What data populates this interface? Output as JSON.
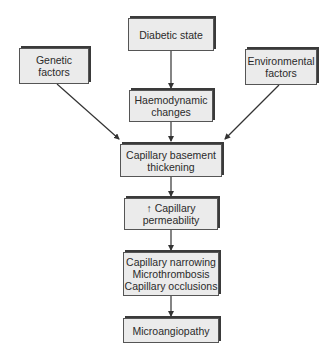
{
  "diagram": {
    "type": "flowchart",
    "nodes": [
      {
        "id": "diabetic",
        "label": "Diabetic state"
      },
      {
        "id": "genetic",
        "label": "Genetic\nfactors"
      },
      {
        "id": "env",
        "label": "Environmental\nfactors"
      },
      {
        "id": "haemo",
        "label": "Haemodynamic\nchanges"
      },
      {
        "id": "basement",
        "label": "Capillary basement\nthickening"
      },
      {
        "id": "perm",
        "label": "↑ Capillary\npermeability"
      },
      {
        "id": "narrow",
        "label": "Capillary narrowing\nMicrothrombosis\nCapillary occlusions"
      },
      {
        "id": "micro",
        "label": "Microangiopathy"
      }
    ],
    "edges": [
      {
        "from": "diabetic",
        "to": "haemo"
      },
      {
        "from": "haemo",
        "to": "basement"
      },
      {
        "from": "genetic",
        "to": "basement"
      },
      {
        "from": "env",
        "to": "basement"
      },
      {
        "from": "basement",
        "to": "perm"
      },
      {
        "from": "perm",
        "to": "narrow"
      },
      {
        "from": "narrow",
        "to": "micro"
      }
    ],
    "colors": {
      "box_fill": "#ebebeb",
      "box_border": "#555555",
      "box_shadow": "#3a3a3a",
      "arrow": "#333333",
      "text": "#2a2a2a"
    }
  }
}
